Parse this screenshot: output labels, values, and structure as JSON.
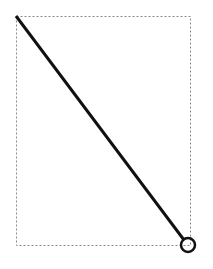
{
  "canvas": {
    "width": 213,
    "height": 269,
    "background": "#ffffff"
  },
  "selection_box": {
    "x1": 16,
    "y1": 16,
    "x2": 190,
    "y2": 245,
    "stroke": "#888888",
    "dash": "2,2"
  },
  "line": {
    "x1": 16,
    "y1": 16,
    "x2": 184,
    "y2": 240,
    "stroke": "#111111",
    "width": 3
  },
  "end_handle": {
    "cx": 188,
    "cy": 245,
    "r": 7,
    "stroke": "#111111",
    "width": 2.5
  }
}
